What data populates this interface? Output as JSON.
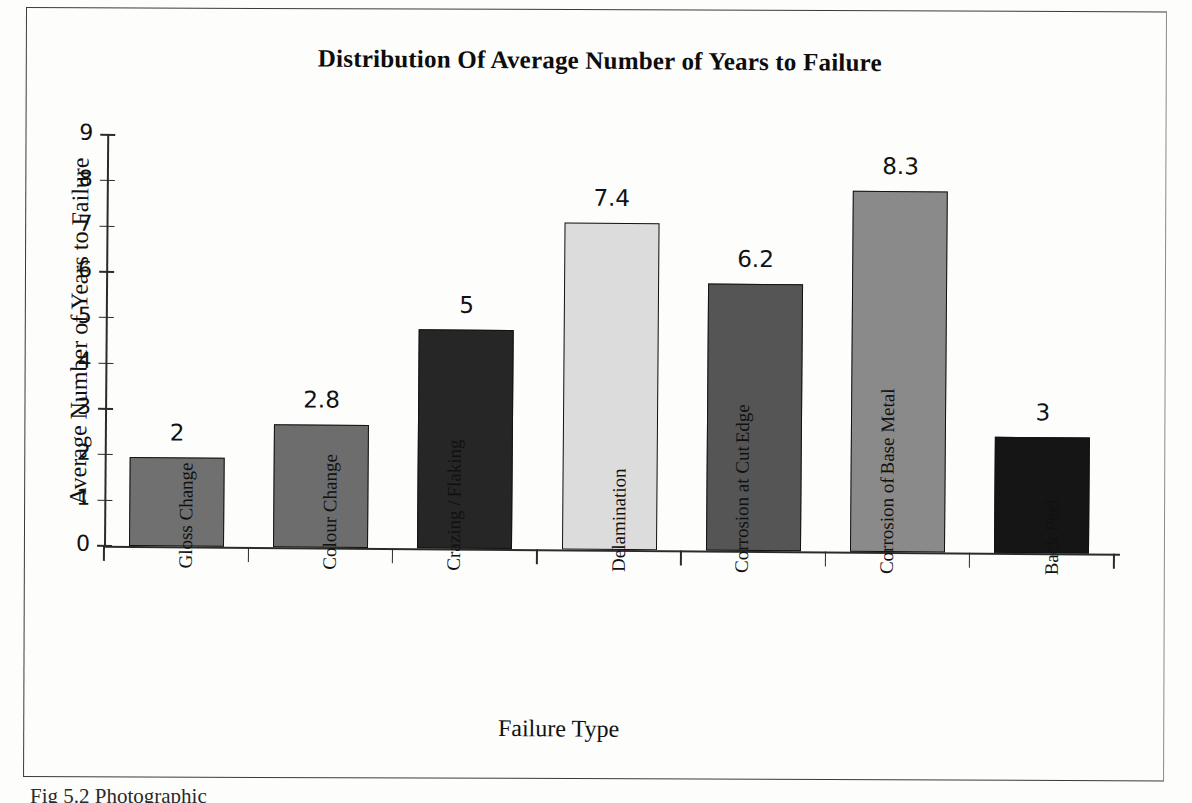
{
  "figure": {
    "caption": "Fig 5.2 Photographic"
  },
  "chart_data": {
    "type": "bar",
    "title": "Distribution Of Average Number of Years to Failure",
    "xlabel": "Failure Type",
    "ylabel": "Average Number of Years to Failure",
    "ylim": [
      0,
      9
    ],
    "ytick_labels": [
      "0",
      "1",
      "2",
      "3",
      "4",
      "5",
      "6",
      "7",
      "8",
      "9"
    ],
    "grid": false,
    "legend": "none",
    "categories": [
      "Gloss Change",
      "Colour Change",
      "Crazing / Flaking",
      "Delamination",
      "Corrosion at Cut Edge",
      "Corrosion of Base Metal",
      "Back Peel"
    ],
    "category_lines": [
      [
        "Gloss Change"
      ],
      [
        "Colour Change"
      ],
      [
        "Crazing /",
        "Flaking"
      ],
      [
        "Delamination"
      ],
      [
        "Corrosion at Cut",
        "Edge"
      ],
      [
        "Corrosion of",
        "Base Metal"
      ],
      [
        "Back Peel"
      ]
    ],
    "values": [
      2,
      2.8,
      5,
      7.4,
      6.2,
      8.3,
      3
    ],
    "value_labels": [
      "2",
      "2.8",
      "5",
      "7.4",
      "6.2",
      "8.3",
      "3"
    ],
    "drawn_heights": [
      1.95,
      2.7,
      4.8,
      7.15,
      5.85,
      7.9,
      2.55
    ],
    "bar_colors": [
      "#707070",
      "#6d6d6d",
      "#262626",
      "#dcdcdc",
      "#555555",
      "#8a8a8a",
      "#151515"
    ],
    "bar_edge_color": "#131313"
  }
}
